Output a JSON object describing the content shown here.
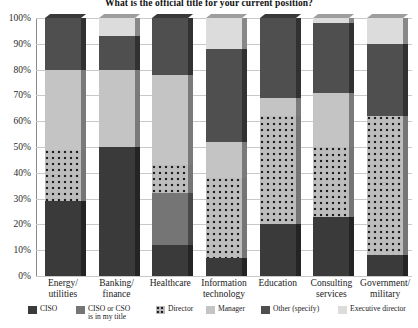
{
  "chart_data": {
    "type": "bar",
    "subtype": "stacked-percentage-3d",
    "title": "What is the official title for your current position?",
    "xlabel": "",
    "ylabel": "",
    "ylim": [
      0,
      100
    ],
    "ytick_labels": [
      "0%",
      "10%",
      "20%",
      "30%",
      "40%",
      "50%",
      "60%",
      "70%",
      "80%",
      "90%",
      "100%"
    ],
    "ytick_values": [
      0,
      10,
      20,
      30,
      40,
      50,
      60,
      70,
      80,
      90,
      100
    ],
    "grid": true,
    "legend_position": "bottom",
    "categories": [
      "Energy/\nutilities",
      "Banking/\nfinance",
      "Healthcare",
      "Information\ntechnology",
      "Education",
      "Consulting\nservices",
      "Government/\nmilitary"
    ],
    "series": [
      {
        "name": "CISO",
        "color": "#3a3a3a",
        "pattern": "solid",
        "values": [
          29,
          50,
          12,
          7,
          20,
          23,
          8
        ]
      },
      {
        "name": "CISO or CSO\nis in my title",
        "color": "#757575",
        "pattern": "solid",
        "values": [
          0,
          0,
          20,
          0,
          0,
          0,
          0
        ]
      },
      {
        "name": "Director",
        "color": "#bdbdbd",
        "pattern": "dotted",
        "values": [
          20,
          0,
          11,
          31,
          42,
          27,
          54
        ]
      },
      {
        "name": "Manager",
        "color": "#c4c4c4",
        "pattern": "solid",
        "values": [
          31,
          30,
          35,
          14,
          7,
          21,
          0
        ]
      },
      {
        "name": "Other (specify)",
        "color": "#4f4f4f",
        "pattern": "solid",
        "values": [
          20,
          13,
          22,
          36,
          31,
          27,
          28
        ]
      },
      {
        "name": "Executive director",
        "color": "#dcdcdc",
        "pattern": "solid",
        "values": [
          0,
          7,
          0,
          12,
          0,
          2,
          10
        ]
      }
    ]
  },
  "legend": {
    "items": [
      {
        "label": "CISO"
      },
      {
        "label": "CISO or CSO\nis in my title"
      },
      {
        "label": "Director"
      },
      {
        "label": "Manager"
      },
      {
        "label": "Other (specify)"
      },
      {
        "label": "Executive director"
      }
    ]
  }
}
